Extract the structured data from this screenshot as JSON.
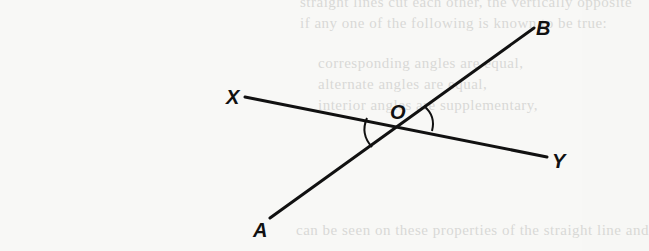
{
  "figure": {
    "ink_color": "#111111",
    "background_color": "#f8f8f6",
    "points": {
      "A": {
        "label": "A",
        "x": 270,
        "y": 218
      },
      "B": {
        "label": "B",
        "x": 534,
        "y": 28
      },
      "X": {
        "label": "X",
        "x": 245,
        "y": 97
      },
      "Y": {
        "label": "Y",
        "x": 547,
        "y": 157
      },
      "O": {
        "label": "O",
        "x": 399,
        "y": 124
      }
    },
    "lines": [
      {
        "name": "AB",
        "from": "A",
        "to": "B"
      },
      {
        "name": "XY",
        "from": "X",
        "to": "Y"
      }
    ],
    "angle_marks": [
      {
        "name": "angle-AOX",
        "between": [
          "XO",
          "OA"
        ],
        "side": "left"
      },
      {
        "name": "angle-BOY",
        "between": [
          "OB",
          "OY"
        ],
        "side": "right"
      }
    ],
    "labels": {
      "A": "A",
      "B": "B",
      "X": "X",
      "Y": "Y",
      "O": "O"
    }
  },
  "bleed_through_text": {
    "line1": "straight lines cut each other, the vertically opposite",
    "line2": "if any one of the following is known to be true:",
    "line3": "corresponding angles are equal,",
    "line4": "alternate angles are equal,",
    "line5": "interior angles are supplementary,",
    "line6": "can be seen on these properties of the straight line and"
  }
}
